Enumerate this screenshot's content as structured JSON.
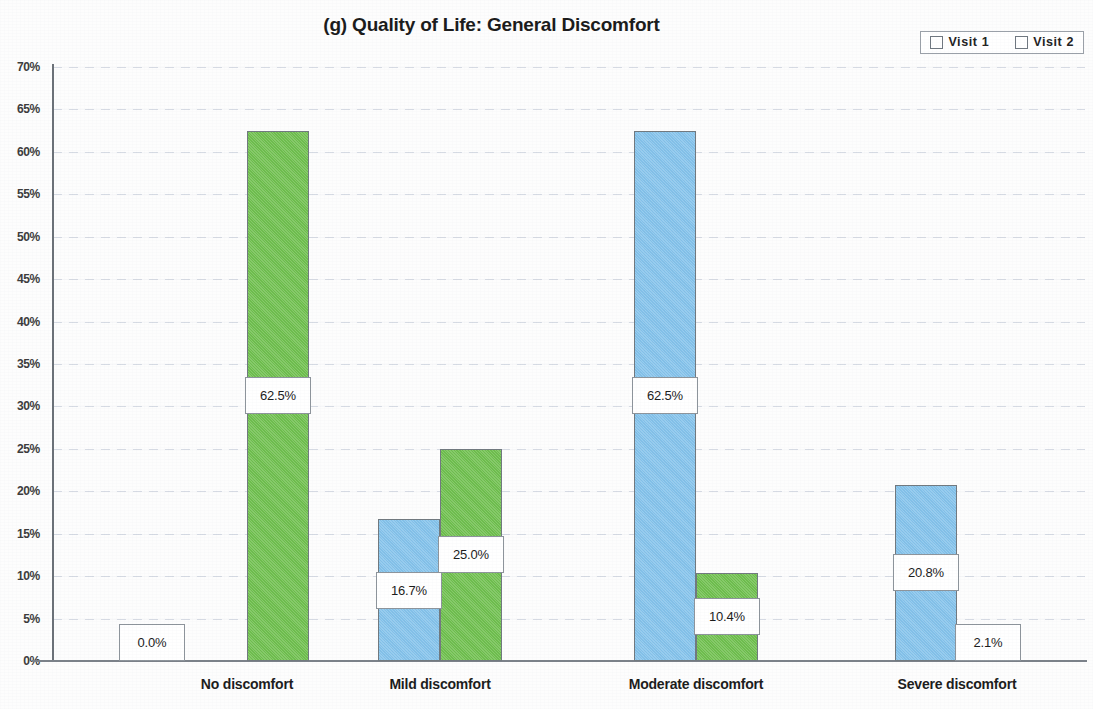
{
  "chart_data": {
    "type": "bar",
    "title": "(g) Quality of Life: General Discomfort",
    "xlabel": "",
    "ylabel": "",
    "ylim": [
      0,
      70
    ],
    "grid": true,
    "legend_position": "top-right",
    "categories": [
      "No discomfort",
      "Mild discomfort",
      "Moderate discomfort",
      "Severe discomfort"
    ],
    "ytick_labels": [
      "0%",
      "5%",
      "10%",
      "15%",
      "20%",
      "25%",
      "30%",
      "35%",
      "40%",
      "45%",
      "50%",
      "55%",
      "60%",
      "65%",
      "70%"
    ],
    "ytick_values": [
      0,
      5,
      10,
      15,
      20,
      25,
      30,
      35,
      40,
      45,
      50,
      55,
      60,
      65,
      70
    ],
    "series": [
      {
        "name": "Visit 1",
        "color": "#84c3ec",
        "values": [
          0.0,
          16.7,
          62.5,
          20.8
        ],
        "labels": [
          "0.0%",
          "16.7%",
          "62.5%",
          "20.8%"
        ]
      },
      {
        "name": "Visit 2",
        "color": "#6fc04e",
        "values": [
          62.5,
          25.0,
          10.4,
          2.1
        ],
        "labels": [
          "62.5%",
          "25.0%",
          "10.4%",
          "2.1%"
        ]
      }
    ]
  }
}
